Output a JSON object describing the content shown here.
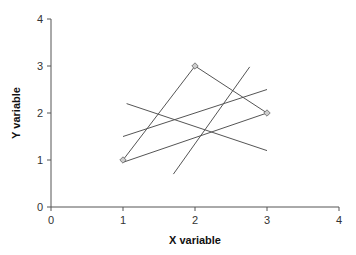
{
  "chart_data": {
    "type": "line",
    "title": "",
    "xlabel": "X variable",
    "ylabel": "Y variable",
    "xlim": [
      0,
      4
    ],
    "ylim": [
      0,
      4
    ],
    "xticks": [
      0,
      1,
      2,
      3,
      4
    ],
    "yticks": [
      0,
      1,
      2,
      3,
      4
    ],
    "grid": false,
    "legend": null,
    "series": [
      {
        "name": "data-path",
        "markers": true,
        "points": [
          [
            1,
            1
          ],
          [
            2,
            3
          ],
          [
            3,
            2
          ]
        ]
      },
      {
        "name": "line-a",
        "markers": false,
        "points": [
          [
            1.0,
            0.95
          ],
          [
            3.0,
            2.0
          ]
        ]
      },
      {
        "name": "line-b",
        "markers": false,
        "points": [
          [
            1.0,
            1.5
          ],
          [
            3.0,
            2.5
          ]
        ]
      },
      {
        "name": "line-c",
        "markers": false,
        "points": [
          [
            1.05,
            2.2
          ],
          [
            3.0,
            1.2
          ]
        ]
      },
      {
        "name": "line-d",
        "markers": false,
        "points": [
          [
            1.7,
            0.7
          ],
          [
            2.76,
            2.98
          ]
        ]
      }
    ]
  },
  "style": {
    "line_color": "#555555",
    "axis_color": "#555555",
    "marker_fill": "#cccccc",
    "marker_stroke": "#666666"
  }
}
